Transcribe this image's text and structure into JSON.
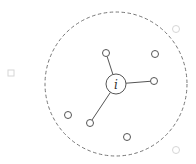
{
  "diagram": {
    "title": "",
    "colors": {
      "stroke": "#555555",
      "dashed": "#777777",
      "faint": "#d6d6d6",
      "background": "#ffffff"
    },
    "neighborhood": {
      "cx": 116,
      "cy": 84,
      "rx": 71,
      "ry": 72,
      "style": "dashed"
    },
    "center_node": {
      "id": "i",
      "label": "i",
      "cx": 116,
      "cy": 84,
      "r": 10
    },
    "inner_nodes": [
      {
        "id": "n1",
        "cx": 106,
        "cy": 53,
        "r": 3.5,
        "connected": true
      },
      {
        "id": "n2",
        "cx": 155,
        "cy": 54,
        "r": 3.5,
        "connected": false
      },
      {
        "id": "n3",
        "cx": 154,
        "cy": 81,
        "r": 3.5,
        "connected": true
      },
      {
        "id": "n4",
        "cx": 68,
        "cy": 115,
        "r": 3.5,
        "connected": false
      },
      {
        "id": "n5",
        "cx": 90,
        "cy": 123,
        "r": 3.5,
        "connected": true
      },
      {
        "id": "n6",
        "cx": 127,
        "cy": 137,
        "r": 3.5,
        "connected": false
      }
    ],
    "outer_nodes": [
      {
        "id": "o1",
        "shape": "square",
        "cx": 11,
        "cy": 73,
        "size": 6
      },
      {
        "id": "o2",
        "shape": "circle",
        "cx": 176,
        "cy": 29,
        "r": 3.5
      },
      {
        "id": "o3",
        "shape": "circle",
        "cx": 176,
        "cy": 150,
        "r": 3.5
      }
    ]
  }
}
